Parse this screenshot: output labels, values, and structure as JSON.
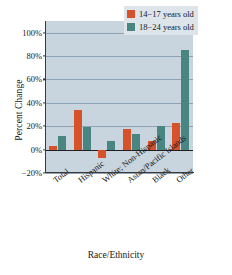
{
  "chart_data": {
    "type": "bar",
    "title": "",
    "xlabel": "Race/Ethnicity",
    "ylabel": "Percent Change",
    "categories": [
      "Total",
      "Hispanic",
      "White; Non-Hispanic",
      "Asian/Pacific Islands",
      "Black",
      "Other"
    ],
    "series": [
      {
        "name": "14−17 years old",
        "color": "#d7512b",
        "values": [
          3,
          34,
          -7,
          18,
          7,
          23
        ]
      },
      {
        "name": "18−24 years old",
        "color": "#4a8681",
        "values": [
          12,
          19,
          7,
          13,
          20,
          85
        ]
      }
    ],
    "ylim": [
      -20,
      110
    ],
    "yticks": [
      -20,
      0,
      20,
      40,
      60,
      80,
      100
    ],
    "ytick_labels": [
      "−20%",
      "0%",
      "20%",
      "40%",
      "60%",
      "80%",
      "100%"
    ],
    "grid": true,
    "legend_position": "top-right",
    "plot_background": "#c9d5de"
  }
}
